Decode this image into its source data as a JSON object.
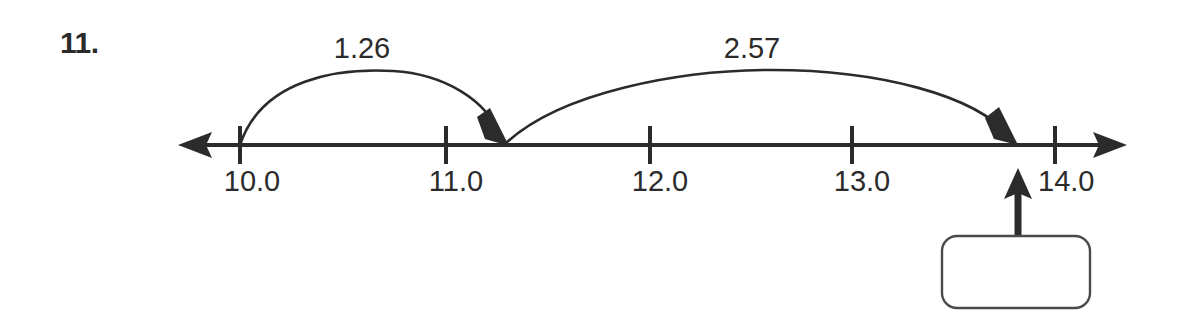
{
  "problem": {
    "number_label": "11.",
    "type": "number-line-addition"
  },
  "number_line": {
    "ticks": [
      {
        "label": "10.0",
        "value": 10.0
      },
      {
        "label": "11.0",
        "value": 11.0
      },
      {
        "label": "12.0",
        "value": 12.0
      },
      {
        "label": "13.0",
        "value": 13.0
      },
      {
        "label": "14.0",
        "value": 14.0
      }
    ],
    "range_start": 10.0,
    "range_end": 14.0,
    "left_arrow": "left-arrowhead",
    "right_arrow": "right-arrowhead"
  },
  "jumps": [
    {
      "label": "1.26",
      "amount": 1.26,
      "from_value": 10.0,
      "to_value": 11.26,
      "direction": "right"
    },
    {
      "label": "2.57",
      "amount": 2.57,
      "from_value": 11.26,
      "to_value": 13.83,
      "direction": "right"
    }
  ],
  "answer": {
    "box_value": "",
    "pointer": "up-arrow-to-number-line",
    "points_to_value": 13.83
  },
  "colors": {
    "ink": "#2b2b2b",
    "box_border": "#4a4a4a",
    "paper": "#ffffff"
  }
}
